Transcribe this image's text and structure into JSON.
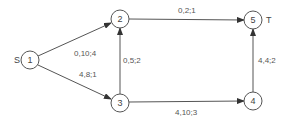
{
  "diagram": {
    "type": "flow-network",
    "source_label": "S",
    "sink_label": "T",
    "nodes": [
      {
        "id": "1",
        "label": "1",
        "x": 30,
        "y": 60
      },
      {
        "id": "2",
        "label": "2",
        "x": 120,
        "y": 19
      },
      {
        "id": "3",
        "label": "3",
        "x": 120,
        "y": 103
      },
      {
        "id": "4",
        "label": "4",
        "x": 253,
        "y": 101
      },
      {
        "id": "5",
        "label": "5",
        "x": 253,
        "y": 20
      }
    ],
    "edges": [
      {
        "from": "1",
        "to": "2",
        "label": "0,10;4"
      },
      {
        "from": "1",
        "to": "3",
        "label": "4,8;1"
      },
      {
        "from": "3",
        "to": "2",
        "label": "0,5;2"
      },
      {
        "from": "2",
        "to": "5",
        "label": "0,2;1"
      },
      {
        "from": "3",
        "to": "4",
        "label": "4,10;3"
      },
      {
        "from": "4",
        "to": "5",
        "label": "4,4;2"
      }
    ]
  }
}
